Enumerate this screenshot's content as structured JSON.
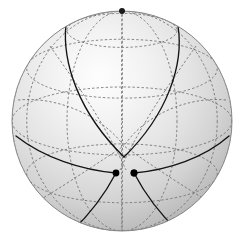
{
  "figure": {
    "kind": "sphere-diagram",
    "background_color": "#ffffff"
  },
  "sphere": {
    "center_x": 122,
    "center_y": 121,
    "radius": 110,
    "tilt_degrees": 18,
    "rotation_degrees": 0,
    "limb_color": "#8a8a8a",
    "fill_light": "#fefefe",
    "fill_mid": "#dcdcdc",
    "fill_dark": "#a8a8a8",
    "highlight_x_percent": 40,
    "highlight_y_percent": 30
  },
  "graticule": {
    "color": "#6e6e6e",
    "style": "dashed",
    "dash_pattern": "2.4 2.1",
    "stroke_width": 0.85,
    "latitude_step_degrees": 30,
    "longitude_step_degrees": 30,
    "latitudes": [
      -60,
      -30,
      0,
      30,
      60
    ],
    "longitudes": [
      -180,
      -150,
      -120,
      -90,
      -60,
      -30,
      0,
      30,
      60,
      90,
      120,
      150
    ],
    "equator_label": "equator",
    "hidden_lines_dashed": true
  },
  "geodesics": {
    "color": "#141414",
    "stroke_width": 1.35,
    "description": "Three great-circle arcs forming a small spherical triangle near the front center",
    "count": 3
  },
  "vertices": [
    {
      "name": "apex",
      "x": 124,
      "y": 157,
      "radius": 3.4,
      "color": "#000000"
    },
    {
      "name": "lower-left",
      "x": 116,
      "y": 173,
      "radius": 3.4,
      "color": "#000000"
    },
    {
      "name": "lower-right",
      "x": 134,
      "y": 173,
      "radius": 3.4,
      "color": "#000000"
    }
  ],
  "pole": {
    "name": "north-pole",
    "x": 122,
    "y": 11,
    "radius": 3.0,
    "color": "#1a1a1a"
  }
}
